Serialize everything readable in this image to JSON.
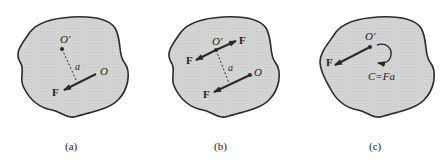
{
  "figure": {
    "colors": {
      "body_fill": "#d4d4d4",
      "outline": "#2a2a2a",
      "force": "#2a2a2a",
      "text": "#222222"
    },
    "panels": [
      {
        "id": "a",
        "caption": "(a)",
        "point_O_prime": "O′",
        "point_O": "O",
        "force_label": "F",
        "distance_label": "a"
      },
      {
        "id": "b",
        "caption": "(b)",
        "point_O_prime": "O′",
        "point_O": "O",
        "force_label_upper_right": "F",
        "force_label_upper_left": "F",
        "force_label_lower": "F",
        "distance_label": "a"
      },
      {
        "id": "c",
        "caption": "(c)",
        "point_O_prime": "O′",
        "force_label": "F",
        "couple_label": "C=Fa"
      }
    ]
  }
}
